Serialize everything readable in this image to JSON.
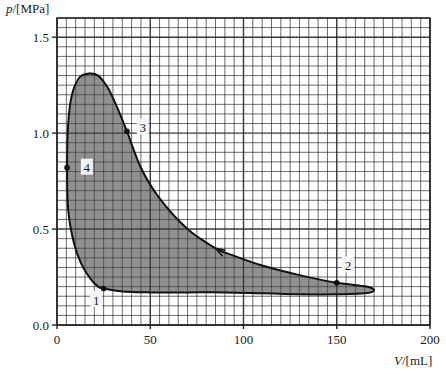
{
  "chart_data": {
    "type": "line",
    "title": "",
    "xlabel": "V / [mL]",
    "ylabel": "p / [MPa]",
    "xlabel_var": "V",
    "xlabel_unit": "/[mL]",
    "ylabel_var": "p",
    "ylabel_unit": "/[MPa]",
    "xlim": [
      0,
      200
    ],
    "ylim": [
      0,
      1.6
    ],
    "xticks": [
      0,
      50,
      100,
      150,
      200
    ],
    "xtick_labels": [
      "0",
      "50",
      "100",
      "150",
      "200"
    ],
    "yticks": [
      0.0,
      0.5,
      1.0,
      1.5
    ],
    "ytick_labels": [
      "0.0",
      "0.5",
      "1.0",
      "1.5"
    ],
    "grid": {
      "on": true,
      "minor_x_step": 5,
      "minor_y_step": 0.05,
      "major_x_step": 50,
      "major_y_step": 0.5
    },
    "legend": null,
    "series": [
      {
        "name": "p-V loop",
        "closed": true,
        "fill": "#8a8a8a",
        "x": [
          25,
          35,
          50,
          70,
          90,
          110,
          130,
          150,
          165,
          170,
          166,
          150,
          130,
          110,
          95,
          85,
          70,
          55,
          45,
          37.5,
          32,
          27,
          22,
          17,
          12,
          8,
          6,
          5.4,
          6,
          9,
          13,
          18,
          22,
          25
        ],
        "y": [
          0.19,
          0.175,
          0.17,
          0.17,
          0.17,
          0.165,
          0.16,
          0.16,
          0.165,
          0.18,
          0.2,
          0.22,
          0.26,
          0.31,
          0.36,
          0.4,
          0.5,
          0.66,
          0.82,
          1.01,
          1.14,
          1.24,
          1.3,
          1.31,
          1.29,
          1.2,
          1.05,
          0.82,
          0.6,
          0.43,
          0.32,
          0.24,
          0.2,
          0.19
        ]
      }
    ],
    "annotations": [
      {
        "label": "1",
        "x": 25,
        "y": 0.19,
        "text_x": 21,
        "text_y": 0.13
      },
      {
        "label": "2",
        "x": 150,
        "y": 0.22,
        "text_x": 156,
        "text_y": 0.31
      },
      {
        "label": "3",
        "x": 37.5,
        "y": 1.01,
        "text_x": 46,
        "text_y": 1.03
      },
      {
        "label": "4",
        "x": 5.4,
        "y": 0.82,
        "text_x": 16,
        "text_y": 0.82
      }
    ],
    "arrow": {
      "x": 85,
      "y": 0.4,
      "direction": "toward upper-left along upper curve"
    }
  }
}
